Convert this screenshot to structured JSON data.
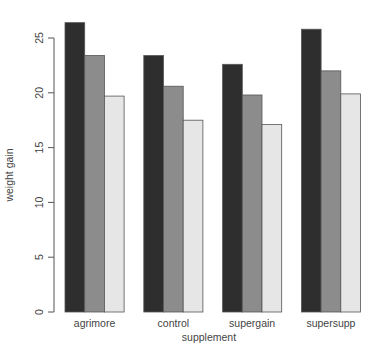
{
  "chart_data": {
    "type": "bar",
    "subtype": "grouped",
    "title": "",
    "xlabel": "supplement",
    "ylabel": "weight gain",
    "categories": [
      "agrimore",
      "control",
      "supergain",
      "supersupp"
    ],
    "series": [
      {
        "name": "series 1",
        "color": "#2e2e2e",
        "values": [
          26.4,
          23.4,
          22.6,
          25.8
        ]
      },
      {
        "name": "series 2",
        "color": "#8c8c8c",
        "values": [
          23.4,
          20.6,
          19.8,
          22.0
        ]
      },
      {
        "name": "series 3",
        "color": "#e6e6e6",
        "values": [
          19.7,
          17.5,
          17.1,
          19.9
        ]
      }
    ],
    "yticks": [
      0,
      5,
      10,
      15,
      20,
      25
    ],
    "ylim": [
      0,
      25
    ],
    "grid": false,
    "legend": "none"
  },
  "labels": {
    "xlabel": "supplement",
    "ylabel": "weight gain",
    "yticks": [
      "0",
      "5",
      "10",
      "15",
      "20",
      "25"
    ],
    "categories": [
      "agrimore",
      "control",
      "supergain",
      "supersupp"
    ]
  }
}
